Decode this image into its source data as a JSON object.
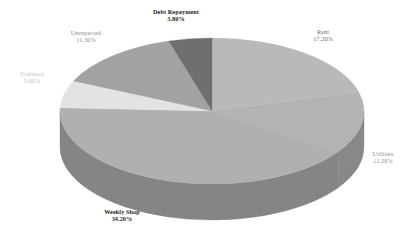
{
  "chart_data": {
    "type": "pie",
    "title": "",
    "three_d": true,
    "legend": "none",
    "labels_position": "outside",
    "categories": [
      "Rent",
      "Utilities",
      "Weekly Shop",
      "Transport",
      "Unexpected",
      "Debt Repayment"
    ],
    "values": [
      17.2,
      11.2,
      34.2,
      5.0,
      11.3,
      3.8
    ],
    "value_unit": "%",
    "slices": [
      {
        "name": "Rent",
        "pct": "17.20%",
        "value": 17.2,
        "color": "#b9b9b9",
        "side_color": "#8d8d8d",
        "label_style": "mid"
      },
      {
        "name": "Utilities",
        "pct": "11.20%",
        "value": 11.2,
        "color": "#b3b3b3",
        "side_color": "#888888",
        "label_style": "grey"
      },
      {
        "name": "Weekly Shop",
        "pct": "34.20%",
        "value": 34.2,
        "color": "#b0b0b0",
        "side_color": "#858585",
        "label_style": "dark"
      },
      {
        "name": "Transport",
        "pct": "5.00%",
        "value": 5.0,
        "color": "#e3e3e3",
        "side_color": "#b4b4b4",
        "label_style": "light"
      },
      {
        "name": "Unexpected",
        "pct": "11.30%",
        "value": 11.3,
        "color": "#a2a2a2",
        "side_color": "#7c7c7c",
        "label_style": "grey"
      },
      {
        "name": "Debt Repayment",
        "pct": "3.80%",
        "value": 3.8,
        "color": "#6f6f6f",
        "side_color": "#555555",
        "label_style": "dark"
      }
    ],
    "background": "#ffffff"
  },
  "labels": {
    "debt_name": "Debt Repayment",
    "debt_pct": "3.80%",
    "rent_name": "Rent",
    "rent_pct": "17.20%",
    "utilities_name": "Utilities",
    "utilities_pct": "11.20%",
    "weekly_name": "Weekly Shop",
    "weekly_pct": "34.20%",
    "transport_name": "Transport",
    "transport_pct": "5.00%",
    "unexpected_name": "Unexpected",
    "unexpected_pct": "11.30%"
  }
}
